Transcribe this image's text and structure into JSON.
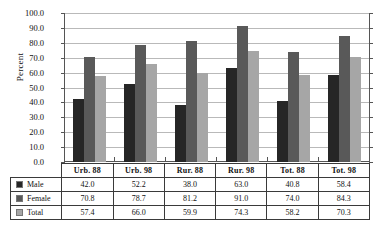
{
  "chart_data": {
    "type": "bar",
    "title": "",
    "xlabel": "",
    "ylabel": "Percent",
    "ylim": [
      0,
      100
    ],
    "ytick_step": 10,
    "ytick_labels": [
      "100.0",
      "90.0",
      "80.0",
      "70.0",
      "60.0",
      "50.0",
      "40.0",
      "30.0",
      "20.0",
      "10.0",
      "0.0"
    ],
    "grid": true,
    "legend_position": "table-left-column",
    "categories": [
      "Urb. 88",
      "Urb. 98",
      "Rur. 88",
      "Rur. 98",
      "Tot. 88",
      "Tot. 98"
    ],
    "series": [
      {
        "name": "Male",
        "color": "#262626",
        "values": [
          42.0,
          52.2,
          38.0,
          63.0,
          40.8,
          58.4
        ],
        "labels": [
          "42.0",
          "52.2",
          "38.0",
          "63.0",
          "40.8",
          "58.4"
        ]
      },
      {
        "name": "Female",
        "color": "#595959",
        "values": [
          70.8,
          78.7,
          81.2,
          91.0,
          74.0,
          84.3
        ],
        "labels": [
          "70.8",
          "78.7",
          "81.2",
          "91.0",
          "74.0",
          "84.3"
        ]
      },
      {
        "name": "Total",
        "color": "#a6a6a6",
        "values": [
          57.4,
          66.0,
          59.9,
          74.3,
          58.2,
          70.3
        ],
        "labels": [
          "57.4",
          "66.0",
          "59.9",
          "74.3",
          "58.2",
          "70.3"
        ]
      }
    ]
  },
  "colors": {
    "male": "#262626",
    "female": "#595959",
    "total": "#a6a6a6",
    "gridline": "#b9b9b9",
    "axis": "#555555",
    "table_border": "#3a3a3a",
    "background": "#ffffff"
  }
}
